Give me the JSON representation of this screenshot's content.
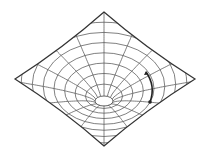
{
  "diagram": {
    "type": "gravity-well",
    "colors": {
      "background": "#ffffff",
      "grid": "#555555",
      "outline": "#333333",
      "arrow": "#222222"
    },
    "sheet": {
      "top": [
        104,
        12
      ],
      "right": [
        195,
        79
      ],
      "bottom": [
        104,
        146
      ],
      "left": [
        15,
        79
      ]
    },
    "funnel": {
      "throat_center": [
        104,
        101
      ],
      "throat_rx": 9,
      "throat_ry": 5,
      "ring_count": 9,
      "radial_count": 16
    },
    "orbit_arrow": {
      "start": [
        146,
        72
      ],
      "end": [
        150,
        102
      ],
      "control": [
        156,
        86
      ]
    }
  }
}
